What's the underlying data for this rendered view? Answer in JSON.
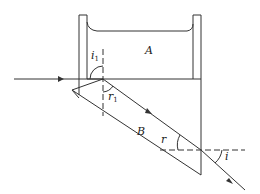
{
  "diagram": {
    "labels": {
      "medium_a": "A",
      "medium_b": "B",
      "angle_i1": "i",
      "angle_i1_sub": "1",
      "angle_r1": "r",
      "angle_r1_sub": "1",
      "angle_r": "r",
      "angle_i": "i"
    },
    "colors": {
      "line": "#333333",
      "background": "#ffffff"
    }
  }
}
